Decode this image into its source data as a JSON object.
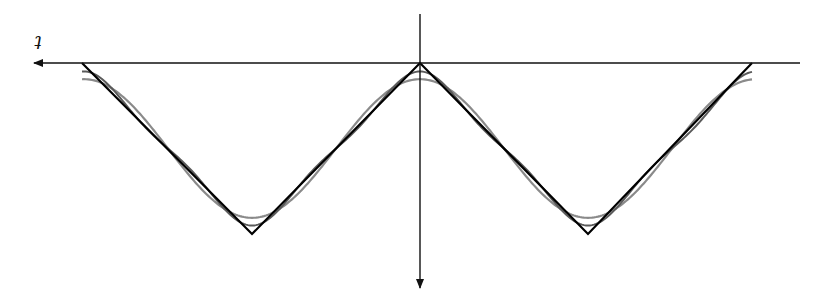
{
  "figure": {
    "axis_label": "t",
    "colors": {
      "axes": "#111111",
      "triangle_wave": "#000000",
      "approx_1": "#8a8a8a",
      "approx_2": "#555555"
    }
  },
  "axes": {
    "horizontal": {
      "x1": 800,
      "y": 63,
      "x2": 34,
      "arrow": "left"
    },
    "vertical": {
      "x": 420,
      "y1": 14,
      "y2": 288,
      "arrow": "down"
    }
  },
  "triangle_wave": {
    "points": [
      [
        82,
        63
      ],
      [
        252,
        234
      ],
      [
        420,
        63
      ],
      [
        588,
        234
      ],
      [
        752,
        63
      ]
    ]
  },
  "label_position": {
    "x": 38,
    "y": 48
  }
}
